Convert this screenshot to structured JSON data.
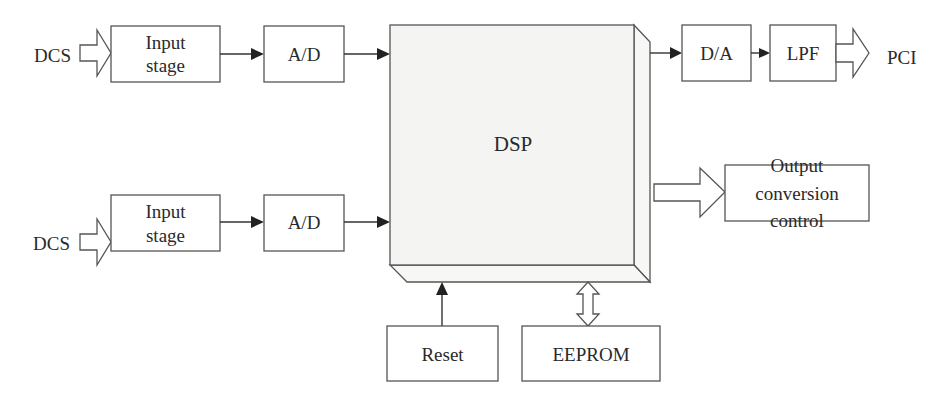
{
  "diagram": {
    "type": "block-diagram",
    "inputs": [
      {
        "source": "DCS",
        "stage": "Input\nstage",
        "stage_lines": [
          "Input",
          "stage"
        ],
        "converter": "A/D"
      },
      {
        "source": "DCS",
        "stage": "Input\nstage",
        "stage_lines": [
          "Input",
          "stage"
        ],
        "converter": "A/D"
      }
    ],
    "processor": "DSP",
    "outputs": {
      "dac": "D/A",
      "filter": "LPF",
      "destination": "PCI",
      "control_lines": [
        "Output",
        "conversion",
        "control"
      ]
    },
    "peripherals": {
      "reset": "Reset",
      "memory": "EEPROM"
    },
    "edges": [
      {
        "from": "DCS (top)",
        "to": "Input stage (top)",
        "style": "hollow-arrow"
      },
      {
        "from": "Input stage (top)",
        "to": "A/D (top)",
        "style": "arrow"
      },
      {
        "from": "A/D (top)",
        "to": "DSP",
        "style": "arrow"
      },
      {
        "from": "DCS (bottom)",
        "to": "Input stage (bottom)",
        "style": "hollow-arrow"
      },
      {
        "from": "Input stage (bottom)",
        "to": "A/D (bottom)",
        "style": "arrow"
      },
      {
        "from": "A/D (bottom)",
        "to": "DSP",
        "style": "arrow"
      },
      {
        "from": "DSP",
        "to": "D/A",
        "style": "arrow"
      },
      {
        "from": "D/A",
        "to": "LPF",
        "style": "arrow"
      },
      {
        "from": "LPF",
        "to": "PCI",
        "style": "hollow-arrow"
      },
      {
        "from": "DSP",
        "to": "Output conversion control",
        "style": "hollow-arrow"
      },
      {
        "from": "Reset",
        "to": "DSP",
        "style": "arrow"
      },
      {
        "from": "DSP",
        "to": "EEPROM",
        "style": "hollow-double-arrow"
      }
    ]
  }
}
